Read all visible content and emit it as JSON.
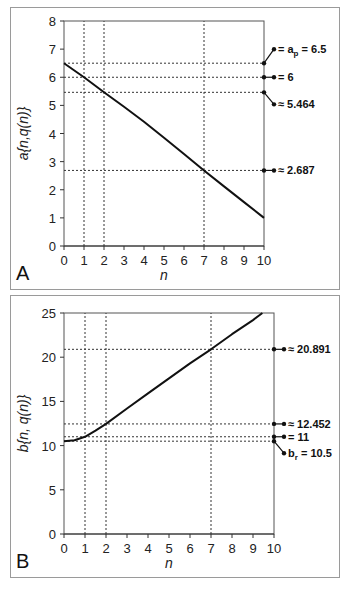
{
  "chart_data": [
    {
      "panel": "A",
      "type": "line",
      "xlabel": "n",
      "ylabel": "a{n,q(n)}",
      "xlim": [
        0,
        10
      ],
      "ylim": [
        0,
        8
      ],
      "xticks": [
        0,
        1,
        2,
        3,
        4,
        5,
        6,
        7,
        8,
        9,
        10
      ],
      "yticks": [
        0,
        1,
        2,
        3,
        4,
        5,
        6,
        7,
        8
      ],
      "grid": false,
      "series": [
        {
          "name": "a{n,q(n)}",
          "x": [
            0,
            1,
            2,
            3,
            4,
            5,
            6,
            7,
            8,
            9,
            10
          ],
          "values": [
            6.5,
            6.0,
            5.464,
            4.95,
            4.42,
            3.85,
            3.27,
            2.687,
            2.12,
            1.56,
            1.0
          ]
        }
      ],
      "reference_lines": {
        "vertical": [
          1,
          2,
          7
        ],
        "horizontal": [
          6.5,
          6,
          5.464,
          2.687
        ]
      },
      "annotations": [
        {
          "y": 6.5,
          "text": "= a",
          "sub": "p",
          "suffix": " = 6.5"
        },
        {
          "y": 6,
          "text": "= 6"
        },
        {
          "y": 5.464,
          "text": "≈ 5.464"
        },
        {
          "y": 2.687,
          "text": "≈ 2.687"
        }
      ]
    },
    {
      "panel": "B",
      "type": "line",
      "xlabel": "n",
      "ylabel": "b{n, q(n)}",
      "xlim": [
        0,
        10
      ],
      "ylim": [
        0,
        25
      ],
      "xticks": [
        0,
        1,
        2,
        3,
        4,
        5,
        6,
        7,
        8,
        9,
        10
      ],
      "yticks": [
        0,
        5,
        10,
        15,
        20,
        25
      ],
      "grid": false,
      "series": [
        {
          "name": "b{n,q(n)}",
          "x": [
            0,
            0.5,
            1,
            1.5,
            2,
            3,
            4,
            5,
            6,
            7,
            8,
            9,
            9.45
          ],
          "values": [
            10.5,
            10.6,
            11.0,
            11.7,
            12.452,
            14.2,
            15.9,
            17.6,
            19.3,
            20.891,
            22.6,
            24.2,
            25.0
          ]
        }
      ],
      "reference_lines": {
        "vertical": [
          1,
          2,
          7
        ],
        "horizontal": [
          20.891,
          12.452,
          11,
          10.5
        ]
      },
      "annotations": [
        {
          "y": 20.891,
          "text": "≈ 20.891"
        },
        {
          "y": 12.452,
          "text": "≈ 12.452"
        },
        {
          "y": 11,
          "text": "= 11"
        },
        {
          "y": 10.5,
          "text": "b",
          "sub": "r",
          "suffix": " = 10.5"
        }
      ]
    }
  ],
  "labels": {
    "panel_a": "A",
    "panel_b": "B",
    "xlabel": "n",
    "ylabel_a": "a{n,q(n)}",
    "ylabel_b": "b{n, q(n)}",
    "ann_a1_pre": "= a",
    "ann_a1_sub": "p",
    "ann_a1_post": " = 6.5",
    "ann_a2": "= 6",
    "ann_a3": "≈ 5.464",
    "ann_a4": "≈ 2.687",
    "ann_b1": "≈ 20.891",
    "ann_b2": "≈ 12.452",
    "ann_b3": "= 11",
    "ann_b4_pre": "b",
    "ann_b4_sub": "r",
    "ann_b4_post": " = 10.5"
  }
}
